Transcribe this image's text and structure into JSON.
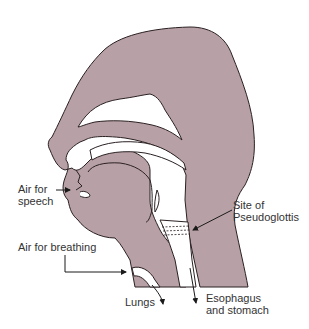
{
  "figure": {
    "colors": {
      "tissue": "#b8a1a6",
      "outline": "#2a2022",
      "background": "#ffffff",
      "text": "#333333"
    },
    "labels": {
      "air_for_speech_line1": "Air for",
      "air_for_speech_line2": "speech",
      "site_line1": "Site of",
      "site_line2": "Pseudoglottis",
      "air_for_breathing": "Air for breathing",
      "lungs": "Lungs",
      "esophagus_line1": "Esophagus",
      "esophagus_line2": "and stomach"
    }
  }
}
